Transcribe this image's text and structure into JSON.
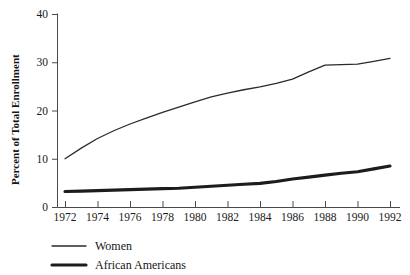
{
  "chart_data": {
    "type": "line",
    "title": "",
    "xlabel": "",
    "ylabel": "Percent of Total Enrollment",
    "xlim": [
      1972,
      1992
    ],
    "ylim": [
      0,
      40
    ],
    "grid": false,
    "legend_position": "bottom-left",
    "x": [
      1972,
      1973,
      1974,
      1975,
      1976,
      1977,
      1978,
      1979,
      1980,
      1981,
      1982,
      1983,
      1984,
      1985,
      1986,
      1987,
      1988,
      1989,
      1990,
      1991,
      1992
    ],
    "xticks": [
      1972,
      1974,
      1976,
      1978,
      1980,
      1982,
      1984,
      1986,
      1988,
      1990,
      1992
    ],
    "xtick_labels": [
      "1972",
      "1974",
      "1976",
      "1978",
      "1980",
      "1982",
      "1984",
      "1986",
      "1988",
      "1990",
      "1992"
    ],
    "yticks": [
      0,
      10,
      20,
      30,
      40
    ],
    "ytick_labels": [
      "0",
      "10",
      "20",
      "30",
      "40"
    ],
    "series": [
      {
        "name": "Women",
        "style": "thin",
        "color": "#2b2b2b",
        "values": [
          10.0,
          12.2,
          14.2,
          15.8,
          17.2,
          18.4,
          19.6,
          20.7,
          21.8,
          22.8,
          23.6,
          24.3,
          24.9,
          25.6,
          26.5,
          28.0,
          29.4,
          29.5,
          29.6,
          30.2,
          30.8
        ]
      },
      {
        "name": "African Americans",
        "style": "thick",
        "color": "#1c1c1c",
        "values": [
          3.2,
          3.3,
          3.4,
          3.5,
          3.6,
          3.7,
          3.8,
          3.9,
          4.1,
          4.3,
          4.5,
          4.7,
          4.9,
          5.3,
          5.8,
          6.2,
          6.6,
          7.0,
          7.3,
          7.9,
          8.5
        ]
      }
    ]
  },
  "legend": {
    "items": [
      {
        "label": "Women",
        "style": "thin"
      },
      {
        "label": "African Americans",
        "style": "thick"
      }
    ]
  }
}
